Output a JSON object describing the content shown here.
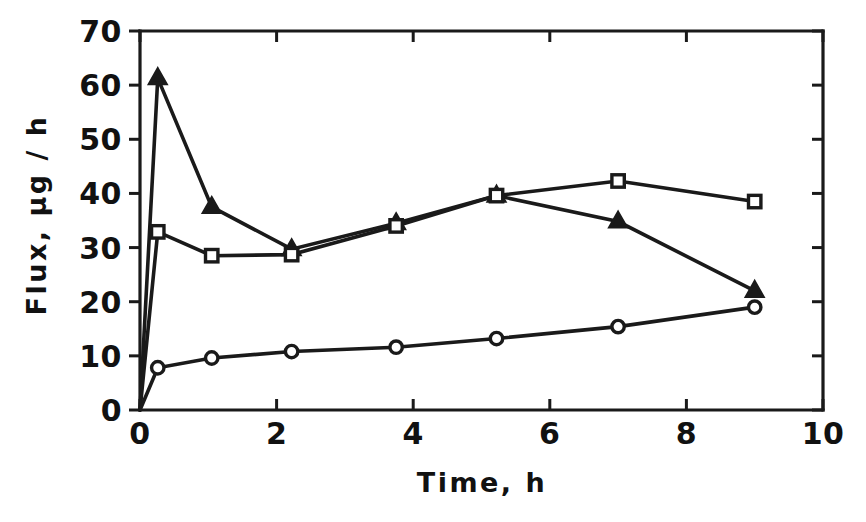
{
  "chart_data": {
    "type": "line",
    "title": "",
    "xlabel": "Time,  h",
    "ylabel": "Flux, µg / h",
    "xlim": [
      0,
      10
    ],
    "ylim": [
      0,
      70
    ],
    "xticks": [
      0,
      2,
      4,
      6,
      8,
      10
    ],
    "xtick_labels": [
      "0",
      "2",
      "4",
      "6",
      "8",
      "10"
    ],
    "yticks": [
      0,
      10,
      20,
      30,
      40,
      50,
      60,
      70
    ],
    "ytick_labels": [
      "0",
      "10",
      "20",
      "30",
      "40",
      "50",
      "60",
      "70"
    ],
    "grid": false,
    "legend": "none",
    "frame": "left-bottom-spines-with-top-and-right-stubs",
    "series": [
      {
        "name": "filled-triangle",
        "marker": "triangle-filled",
        "x": [
          0.0,
          0.26,
          1.05,
          2.22,
          3.75,
          5.22,
          7.0,
          9.0
        ],
        "y": [
          0.0,
          61.3,
          37.5,
          29.7,
          34.5,
          39.6,
          34.8,
          22.0
        ]
      },
      {
        "name": "open-square",
        "marker": "square-open",
        "x": [
          0.0,
          0.26,
          1.05,
          2.22,
          3.75,
          5.22,
          7.0,
          9.0
        ],
        "y": [
          0.0,
          32.9,
          28.5,
          28.7,
          34.0,
          39.6,
          42.3,
          38.5
        ]
      },
      {
        "name": "open-circle",
        "marker": "circle-open",
        "x": [
          0.0,
          0.26,
          1.05,
          2.22,
          3.75,
          5.22,
          7.0,
          9.0
        ],
        "y": [
          0.0,
          7.8,
          9.6,
          10.8,
          11.6,
          13.2,
          15.4,
          19.0
        ]
      }
    ]
  },
  "axes": {
    "x_title": "Time,  h",
    "y_title": "Flux, µg / h"
  },
  "colors": {
    "ink": "#1a1a1a",
    "background": "#ffffff"
  }
}
